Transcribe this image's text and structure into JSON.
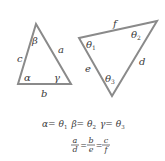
{
  "diagram": {
    "stroke_color": "#8a8a8a",
    "text_color": "#3a3a3a",
    "triangle_left": {
      "vertices": [
        [
          36,
          24
        ],
        [
          18,
          84
        ],
        [
          71,
          84
        ]
      ],
      "sides": {
        "a": "a",
        "b": "b",
        "c": "c"
      },
      "angles": {
        "alpha": "α",
        "beta": "β",
        "gamma": "γ"
      }
    },
    "triangle_right": {
      "vertices": [
        [
          79,
          38
        ],
        [
          157,
          21
        ],
        [
          112,
          96
        ]
      ],
      "sides": {
        "d": "d",
        "e": "e",
        "f": "f"
      },
      "angles": {
        "theta1": "θ",
        "theta1_sub": "1",
        "theta2": "θ",
        "theta2_sub": "2",
        "theta3": "θ",
        "theta3_sub": "3"
      }
    },
    "equations": {
      "line1": {
        "alpha": "α",
        "eq1": "= ",
        "theta1": "θ",
        "sub1": "1",
        "beta": "β",
        "eq2": "= ",
        "theta2": "θ",
        "sub2": "2",
        "gamma": "γ",
        "eq3": "= ",
        "theta3": "θ",
        "sub3": "3"
      },
      "line2": {
        "num1": "a",
        "den1": "d",
        "eqA": "=",
        "num2": "b",
        "den2": "e",
        "eqB": "=",
        "num3": "c",
        "den3": "f"
      }
    }
  }
}
